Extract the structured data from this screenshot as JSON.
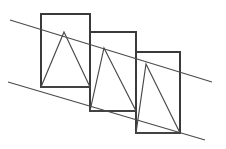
{
  "figure": {
    "background_color": "#ffffff",
    "canvas": {
      "width": 226,
      "height": 149
    },
    "stroke_colors": {
      "rectangle": "#3a3a3a",
      "triangle": "#4a4a4a",
      "diagonal": "#4a4a4a"
    },
    "stroke_widths": {
      "rectangle": 2,
      "triangle": 1.15,
      "diagonal": 1.15
    }
  },
  "chart_data": {
    "type": "line",
    "xlabel": "",
    "ylabel": "",
    "xlim": [
      0,
      226
    ],
    "ylim": [
      149,
      0
    ],
    "grid": false,
    "legend": "none",
    "shapes": [
      {
        "name": "rectangle-1",
        "kind": "rectangle",
        "x": 41,
        "y": 14,
        "width": 49,
        "height": 73,
        "points": [
          [
            41,
            14
          ],
          [
            90,
            14
          ],
          [
            90,
            87
          ],
          [
            41,
            87
          ]
        ]
      },
      {
        "name": "rectangle-2",
        "kind": "rectangle",
        "x": 90,
        "y": 32,
        "width": 46,
        "height": 79,
        "points": [
          [
            90,
            32
          ],
          [
            136,
            32
          ],
          [
            136,
            111
          ],
          [
            90,
            111
          ]
        ]
      },
      {
        "name": "rectangle-3",
        "kind": "rectangle",
        "x": 136,
        "y": 52,
        "width": 44,
        "height": 81,
        "points": [
          [
            136,
            52
          ],
          [
            180,
            52
          ],
          [
            180,
            133
          ],
          [
            136,
            133
          ]
        ]
      },
      {
        "name": "triangle-1",
        "kind": "triangle",
        "apex": [
          64,
          32
        ],
        "points": [
          [
            64,
            32
          ],
          [
            90,
            87
          ],
          [
            41,
            87
          ]
        ]
      },
      {
        "name": "triangle-2",
        "kind": "triangle",
        "apex": [
          104,
          48
        ],
        "points": [
          [
            104,
            48
          ],
          [
            136,
            111
          ],
          [
            90,
            111
          ]
        ]
      },
      {
        "name": "triangle-3",
        "kind": "triangle",
        "apex": [
          146,
          64
        ],
        "points": [
          [
            146,
            64
          ],
          [
            180,
            133
          ],
          [
            136,
            133
          ]
        ]
      },
      {
        "name": "diagonal-upper",
        "kind": "line",
        "points": [
          [
            10,
            20
          ],
          [
            212,
            82
          ]
        ],
        "slope": -0.307
      },
      {
        "name": "diagonal-lower",
        "kind": "line",
        "points": [
          [
            8,
            82
          ],
          [
            205,
            140
          ]
        ],
        "slope": -0.294
      }
    ]
  }
}
